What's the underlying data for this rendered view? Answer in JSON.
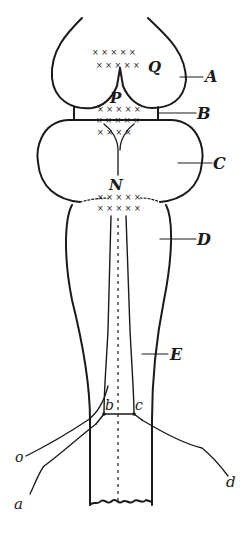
{
  "diagram": {
    "type": "anatomical line drawing (brain / medulla, dorsal view)",
    "labels": {
      "A": "A",
      "B": "B",
      "C": "C",
      "D": "D",
      "E": "E",
      "Q": "Q",
      "P": "P",
      "N": "N",
      "a": "a",
      "b": "b",
      "c": "c",
      "d": "d",
      "o": "o"
    },
    "crosses": {
      "q_row1": "× × × × ×",
      "q_row2": "× × × × ×",
      "p_row1": "× × × × ×",
      "p_row2": "× × × × ×",
      "p_row3": "× × × ×",
      "n_row1": "× × × × ×",
      "n_row2": "× × × × ×"
    },
    "colors": {
      "ink": "#1a1a1a",
      "paper": "#ffffff"
    }
  }
}
